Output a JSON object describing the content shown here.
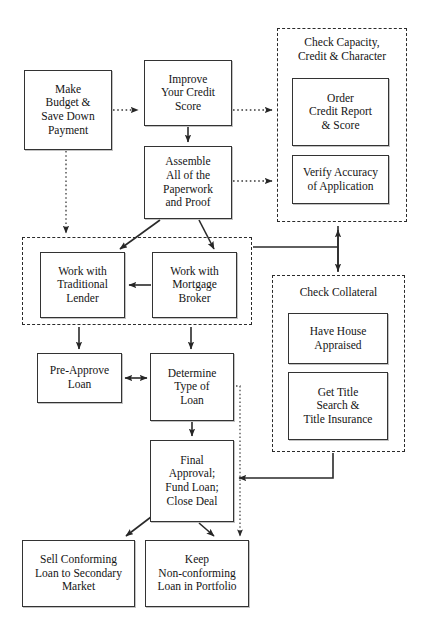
{
  "diagram": {
    "top_cut_text": "",
    "background_color": "#ffffff",
    "node_border_color": "#333333",
    "group_border_color": "#2b2b2b",
    "text_color": "#141414"
  },
  "nodes": [
    {
      "id": "make-budget",
      "label": "Make\nBudget &\nSave Down\nPayment",
      "x": 24,
      "y": 70,
      "w": 88,
      "h": 80
    },
    {
      "id": "improve-credit",
      "label": "Improve\nYour Credit\nScore",
      "x": 144,
      "y": 60,
      "w": 88,
      "h": 66
    },
    {
      "id": "assemble-paperwork",
      "label": "Assemble\nAll of the\nPaperwork\nand Proof",
      "x": 144,
      "y": 146,
      "w": 88,
      "h": 73
    },
    {
      "id": "order-credit",
      "label": "Order\nCredit Report\n& Score",
      "x": 292,
      "y": 78,
      "w": 97,
      "h": 68
    },
    {
      "id": "verify-accuracy",
      "label": "Verify Accuracy\nof Application",
      "x": 292,
      "y": 155,
      "w": 97,
      "h": 49
    },
    {
      "id": "traditional-lender",
      "label": "Work with\nTraditional\nLender",
      "x": 40,
      "y": 252,
      "w": 85,
      "h": 66
    },
    {
      "id": "mortgage-broker",
      "label": "Work with\nMortgage\nBroker",
      "x": 152,
      "y": 252,
      "w": 85,
      "h": 66
    },
    {
      "id": "have-house",
      "label": "Have House\nAppraised",
      "x": 288,
      "y": 313,
      "w": 100,
      "h": 51
    },
    {
      "id": "get-title",
      "label": "Get Title\nSearch &\nTitle Insurance",
      "x": 288,
      "y": 372,
      "w": 100,
      "h": 68
    },
    {
      "id": "pre-approve",
      "label": "Pre-Approve\nLoan",
      "x": 37,
      "y": 353,
      "w": 85,
      "h": 50
    },
    {
      "id": "determine-type",
      "label": "Determine\nType of\nLoan",
      "x": 150,
      "y": 353,
      "w": 84,
      "h": 68
    },
    {
      "id": "final-approval",
      "label": "Final\nApproval;\nFund Loan;\nClose Deal",
      "x": 150,
      "y": 440,
      "w": 84,
      "h": 82
    },
    {
      "id": "sell-conforming",
      "label": "Sell Conforming\nLoan to Secondary\nMarket",
      "x": 22,
      "y": 540,
      "w": 113,
      "h": 67
    },
    {
      "id": "keep-nonconforming",
      "label": "Keep\nNon-conforming\nLoan in Portfolio",
      "x": 145,
      "y": 540,
      "w": 104,
      "h": 67
    }
  ],
  "groups": [
    {
      "id": "check-capacity",
      "label": "Check Capacity,\nCredit & Character",
      "x": 277,
      "y": 28,
      "w": 130,
      "h": 194,
      "label_x": 277,
      "label_y": 36,
      "label_w": 130
    },
    {
      "id": "work-with-group",
      "label": "",
      "x": 22,
      "y": 237,
      "w": 230,
      "h": 88,
      "label_x": 22,
      "label_y": 237,
      "label_w": 230
    },
    {
      "id": "check-collateral",
      "label": "Check Collateral",
      "x": 272,
      "y": 275,
      "w": 133,
      "h": 177,
      "label_x": 272,
      "label_y": 286,
      "label_w": 133
    }
  ],
  "edges": [
    {
      "id": "budget-to-improve",
      "from": "make-budget",
      "to": "improve-credit",
      "style": "dotted"
    },
    {
      "id": "improve-to-capacity",
      "from": "improve-credit",
      "to": "check-capacity",
      "style": "dotted"
    },
    {
      "id": "improve-to-assemble",
      "from": "improve-credit",
      "to": "assemble-paperwork",
      "style": "solid"
    },
    {
      "id": "assemble-to-capacity",
      "from": "assemble-paperwork",
      "to": "check-capacity",
      "style": "dotted"
    },
    {
      "id": "budget-to-workgroup",
      "from": "make-budget",
      "to": "work-with-group",
      "style": "dotted"
    },
    {
      "id": "assemble-to-traditional",
      "from": "assemble-paperwork",
      "to": "traditional-lender",
      "style": "solid"
    },
    {
      "id": "assemble-to-broker",
      "from": "assemble-paperwork",
      "to": "mortgage-broker",
      "style": "solid"
    },
    {
      "id": "broker-to-traditional",
      "from": "mortgage-broker",
      "to": "traditional-lender",
      "style": "solid"
    },
    {
      "id": "capacity-collateral-link",
      "from": "check-capacity",
      "to": "check-collateral",
      "style": "solid-double"
    },
    {
      "id": "workgroup-to-capacity-spur",
      "from": "work-with-group",
      "to": "check-capacity",
      "style": "solid"
    },
    {
      "id": "workgroup-to-preapprove",
      "from": "work-with-group",
      "to": "pre-approve",
      "style": "solid"
    },
    {
      "id": "workgroup-to-determine",
      "from": "work-with-group",
      "to": "determine-type",
      "style": "solid"
    },
    {
      "id": "preapprove-determine",
      "from": "pre-approve",
      "to": "determine-type",
      "style": "solid-double"
    },
    {
      "id": "determine-to-final",
      "from": "determine-type",
      "to": "final-approval",
      "style": "solid"
    },
    {
      "id": "determine-to-keep",
      "from": "determine-type",
      "to": "keep-nonconforming",
      "style": "dotted"
    },
    {
      "id": "collateral-to-final",
      "from": "check-collateral",
      "to": "final-approval",
      "style": "solid"
    },
    {
      "id": "final-to-sell",
      "from": "final-approval",
      "to": "sell-conforming",
      "style": "solid"
    },
    {
      "id": "final-to-keep",
      "from": "final-approval",
      "to": "keep-nonconforming",
      "style": "solid"
    }
  ]
}
